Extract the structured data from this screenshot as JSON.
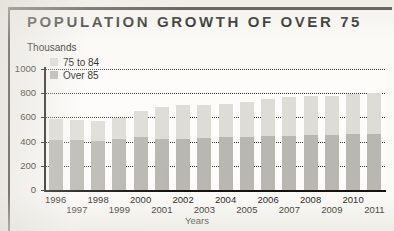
{
  "figure": {
    "title": "POPULATION GROWTH OF OVER 75",
    "y_axis_caption": "Thousands"
  },
  "legend": {
    "items": [
      {
        "label": "75 to 84",
        "color": "#dedcd7",
        "swatch_name": "legend-swatch-75-to-84"
      },
      {
        "label": "Over 85",
        "color": "#b9b7b2",
        "swatch_name": "legend-swatch-over-85"
      }
    ]
  },
  "chart_data": {
    "type": "bar",
    "subtype": "stacked-vertical",
    "title": "POPULATION GROWTH OF OVER 75",
    "subtitle": "",
    "xlabel": "Years",
    "ylabel": "Thousands",
    "ylim": [
      0,
      1000
    ],
    "yticks": [
      0,
      200,
      400,
      600,
      800,
      1000
    ],
    "ytick_labels": [
      "0",
      "200",
      "400",
      "600",
      "800",
      "1000"
    ],
    "grid": "horizontal-dotted",
    "legend_position": "top-left-inside",
    "categories": [
      "1996",
      "1997",
      "1998",
      "1999",
      "2000",
      "2001",
      "2002",
      "2003",
      "2004",
      "2005",
      "2006",
      "2007",
      "2008",
      "2009",
      "2010",
      "2011"
    ],
    "series": [
      {
        "name": "Over 85",
        "color": "#b9b7b2",
        "stack_position": "bottom",
        "values": [
          410,
          410,
          405,
          420,
          435,
          420,
          425,
          430,
          435,
          440,
          445,
          450,
          455,
          455,
          460,
          465
        ]
      },
      {
        "name": "75 to 84",
        "color": "#dedcd7",
        "stack_position": "top",
        "values": [
          180,
          165,
          165,
          175,
          215,
          265,
          275,
          275,
          280,
          285,
          305,
          315,
          320,
          320,
          330,
          335
        ]
      }
    ],
    "totals": [
      590,
      575,
      570,
      595,
      650,
      685,
      700,
      705,
      715,
      725,
      750,
      765,
      775,
      775,
      790,
      800
    ]
  }
}
